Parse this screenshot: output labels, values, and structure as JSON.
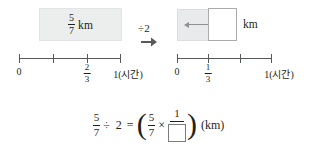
{
  "problem": {
    "left_panel": {
      "bar_label_numerator": "5",
      "bar_label_denominator": "7",
      "bar_unit": "km",
      "numberline": {
        "ticks": [
          {
            "pos": 0,
            "label": "0",
            "type": "text"
          },
          {
            "pos": 0.3333,
            "label": "",
            "type": "none"
          },
          {
            "pos": 0.6667,
            "label": "2/3",
            "num": "2",
            "den": "3",
            "type": "fraction"
          },
          {
            "pos": 1,
            "label": "1(시간)",
            "type": "text"
          }
        ]
      }
    },
    "operation": {
      "symbol": "÷2",
      "arrow": "right-arrow"
    },
    "right_panel": {
      "bar_unit": "km",
      "answer_box_value": "",
      "arrow": "left-arrow",
      "numberline": {
        "ticks": [
          {
            "pos": 0,
            "label": "0",
            "type": "text"
          },
          {
            "pos": 0.3333,
            "label": "1/3",
            "num": "1",
            "den": "3",
            "type": "fraction"
          },
          {
            "pos": 0.6667,
            "label": "",
            "type": "none"
          },
          {
            "pos": 1,
            "label": "1(시간)",
            "type": "text"
          }
        ]
      }
    }
  },
  "equation": {
    "lhs_numerator": "5",
    "lhs_denominator": "7",
    "divide_symbol": "÷",
    "divisor": "2",
    "equals": "=",
    "open_paren": "(",
    "rhs_numerator": "5",
    "rhs_denominator": "7",
    "times_symbol": "×",
    "rhs_frac_numerator": "1",
    "rhs_frac_denominator_box": "",
    "close_paren": ")",
    "unit": "(km)"
  },
  "colors": {
    "shade": "#eceded",
    "line": "#58595b",
    "text": "#231f20",
    "box_border": "#7a7c7e"
  }
}
